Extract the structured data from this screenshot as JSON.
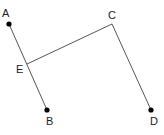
{
  "diagram": {
    "points": {
      "A": {
        "label": "A",
        "x": 9,
        "y": 24,
        "lx": 2,
        "ly": 17,
        "dot": true
      },
      "B": {
        "label": "B",
        "x": 47,
        "y": 110,
        "lx": 46,
        "ly": 125,
        "dot": true
      },
      "C": {
        "label": "C",
        "x": 112,
        "y": 24,
        "lx": 108,
        "ly": 19,
        "dot": false
      },
      "D": {
        "label": "D",
        "x": 151,
        "y": 110,
        "lx": 150,
        "ly": 125,
        "dot": true
      },
      "E": {
        "label": "E",
        "x": 27,
        "y": 64,
        "lx": 16,
        "ly": 73,
        "dot": false
      }
    },
    "segments": [
      {
        "from": "A",
        "to": "B"
      },
      {
        "from": "E",
        "to": "C"
      },
      {
        "from": "C",
        "to": "D"
      }
    ],
    "colors": {
      "line": "#555555",
      "dot": "#000000",
      "label": "#222222"
    }
  }
}
